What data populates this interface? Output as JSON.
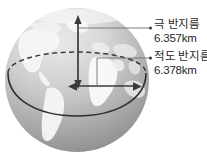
{
  "diagram": {
    "globe": {
      "icon": "earth-globe-icon",
      "equator_line": "equator-ellipse",
      "polar_axis": "polar-axis-arrow",
      "equatorial_axis": "equatorial-radius-arrow"
    },
    "labels": [
      {
        "id": "polar-radius",
        "title": "극 반지름",
        "value": "6.357km"
      },
      {
        "id": "equatorial-radius",
        "title": "적도 반지름",
        "value": "6.378km"
      }
    ],
    "colors": {
      "text": "#272727",
      "leader_line": "#6b6b6b",
      "arrow": "#3a3a3a",
      "ocean_light": "#d9d9d9",
      "ocean_dark": "#9a9a9a",
      "land": "#f4f4f4",
      "background": "#ffffff"
    }
  }
}
